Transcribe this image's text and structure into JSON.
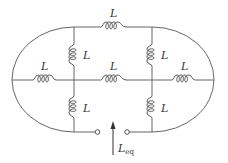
{
  "diagram": {
    "type": "inductor-network",
    "inductor_label": "L",
    "inductors": [
      {
        "id": "top",
        "label": "L",
        "orientation": "horizontal"
      },
      {
        "id": "left-upper",
        "label": "L",
        "orientation": "vertical"
      },
      {
        "id": "right-upper",
        "label": "L",
        "orientation": "vertical"
      },
      {
        "id": "left-middle",
        "label": "L",
        "orientation": "horizontal"
      },
      {
        "id": "center-middle",
        "label": "L",
        "orientation": "horizontal"
      },
      {
        "id": "right-middle",
        "label": "L",
        "orientation": "horizontal"
      },
      {
        "id": "left-lower",
        "label": "L",
        "orientation": "vertical"
      },
      {
        "id": "right-lower",
        "label": "L",
        "orientation": "vertical"
      }
    ],
    "equivalent": {
      "symbol": "L",
      "subscript": "eq"
    },
    "colors": {
      "wire": "#555555",
      "text": "#333333",
      "background": "#ffffff"
    }
  }
}
